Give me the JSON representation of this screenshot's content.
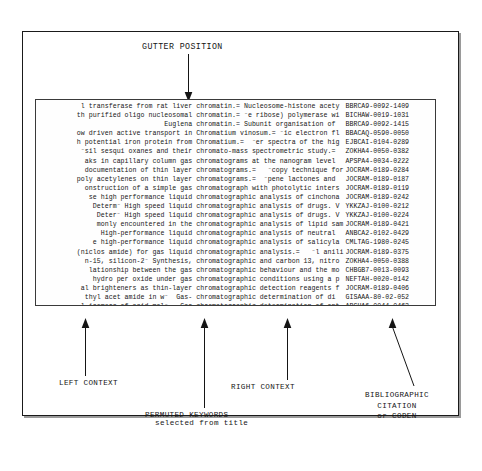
{
  "figure": {
    "gutter_label": "GUTTER POSITION",
    "callouts": {
      "left_context": "LEFT CONTEXT",
      "right_context": "RIGHT CONTEXT",
      "permuted_keywords_line1": "PERMUTED KEYWORDS",
      "permuted_keywords_line2": "selected from title",
      "biblio_line1": "BIBLIOGRAPHIC",
      "biblio_line2": "CITATION",
      "biblio_line3": "or CODEN"
    }
  },
  "kwic": {
    "columns": [
      "left context",
      "permuted keyword",
      "bibliographic citation"
    ],
    "rows": [
      {
        "left": "l transferase from rat liver",
        "mid": "chromatin.= Nucleosome-histone acety",
        "right": "BBRCA9-0092-1409"
      },
      {
        "left": "th purified oligo nucleosomal",
        "mid": "chromatin.= ⁻e ribose) polymerase wi",
        "right": "BICHAW-0019-1031"
      },
      {
        "left": "Euglena",
        "mid": "chromatin.= Subunit organisation of",
        "right": "BBRCA9-0092-1415"
      },
      {
        "left": "ow driven active transport in",
        "mid": "Chromatium vinosum.= ⁻ic electron fl",
        "right": "BBACAQ-0590-0050"
      },
      {
        "left": "h potential iron protein from",
        "mid": "Chromatium.=  ⁻er spectra of the hig",
        "right": "EJBCAI-0104-0289"
      },
      {
        "left": "⁻sil sesqui oxanes and their",
        "mid": "chromato-mass spectrometric study.=",
        "right": "ZOKHA4-0050-0382"
      },
      {
        "left": "aks in capillary column gas",
        "mid": "chromatograms at the nanogram level",
        "right": "APSPA4-0034-0222"
      },
      {
        "left": "documentation of thin layer",
        "mid": "chromatograms.=   ⁻copy technique for",
        "right": "JOCRAM-0189-0284"
      },
      {
        "left": "poly acetylenes on thin layer",
        "mid": "chromatograms.=  ⁻pene lactones and",
        "right": "JOCRAM-0189-0187"
      },
      {
        "left": "onstruction of a simple gas",
        "mid": "chromatograph with photolytic inters",
        "right": "JOCRAM-0189-0119"
      },
      {
        "left": "se high performance liquid",
        "mid": "chromatographic analysis of cinchona",
        "right": "JOCRAM-0189-0242"
      },
      {
        "left": "Determ⁻ High speed liquid",
        "mid": "chromatographic analysis of drugs. V",
        "right": "YKKZAJ-0100-0212"
      },
      {
        "left": "Deter⁻ High speed liquid",
        "mid": "chromatographic analysis of drugs. V",
        "right": "YKKZAJ-0100-0224"
      },
      {
        "left": "monly encountered in the",
        "mid": "chromatographic analysis of lipid sam",
        "right": "JOCRAM-0189-0421"
      },
      {
        "left": "High-performance liquid",
        "mid": "chromatographic analysis of neutral",
        "right": "ANBCA2-0102-0429"
      },
      {
        "left": "e high-performance liquid",
        "mid": "chromatographic analysis of salicyla",
        "right": "CMLTAG-1980-0245"
      },
      {
        "left": "(niclos amide) for gas liquid",
        "mid": "chromatographic analysis.=   ⁻l anili",
        "right": "JOCRAM-0189-0375"
      },
      {
        "left": "n-15, silicon-2⁻ Synthesis,",
        "mid": "chromatographic and carbon 13, nitro",
        "right": "ZOKHA4-0050-0388"
      },
      {
        "left": "lationship between the gas",
        "mid": "chromatographic behaviour and the mo",
        "right": "CHBGB7-0013-0093"
      },
      {
        "left": "hydro per oxide under gas",
        "mid": "chromatographic conditions using a p",
        "right": "NEFTAH-0020-0142"
      },
      {
        "left": "al brighteners as thin-layer",
        "mid": "chromatographic detection reagents f",
        "right": "JOCRAM-0189-0406"
      },
      {
        "left": "thyl acet amide in w⁻  Gas-",
        "mid": "chromatographic determination of di",
        "right": "GISAAA-80-02-052"
      },
      {
        "left": "l isomers of acid mol⁻   Gas",
        "mid": "chromatographic determination of opt",
        "right": "ABCHA6-0044-0463"
      }
    ]
  }
}
